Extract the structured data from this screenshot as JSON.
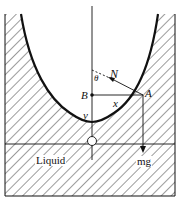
{
  "diagram": {
    "labels": {
      "N": "N",
      "theta": "θ",
      "B": "B",
      "A": "A",
      "x": "x",
      "y": "y",
      "liquid": "Liquid",
      "mg": "mg"
    },
    "colors": {
      "stroke": "#111111",
      "background": "#ffffff"
    }
  }
}
